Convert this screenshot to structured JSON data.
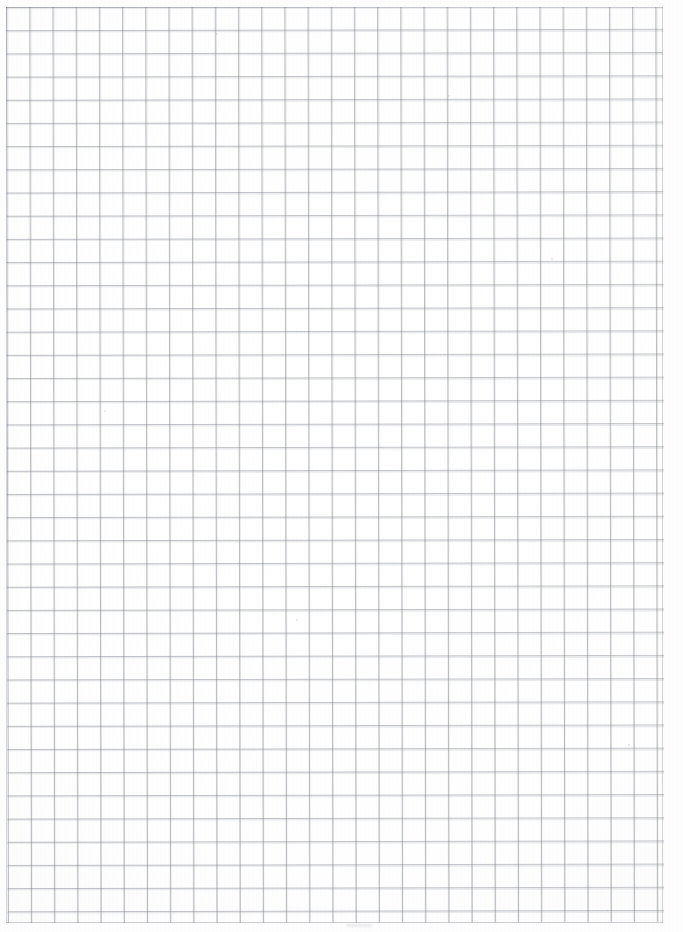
{
  "document": {
    "kind": "scanned-graph-paper",
    "title": "Blank graph paper sheet",
    "description": "Scanned blank square-ruled graph paper with no handwriting, text, labels or markings.",
    "page_width_px": 683,
    "page_height_px": 932,
    "paper_color": "#fdfdfd",
    "grid_line_color": "#787d87",
    "visible_text": ""
  },
  "grid": {
    "cell_size_px": 23.2,
    "columns": 28,
    "rows": 39,
    "origin_x_px": 6,
    "origin_y_px": 6.5,
    "ruled_width_px": 657,
    "ruled_height_px": 916,
    "line_weight_px": 0.9,
    "skew_degrees": -0.12,
    "has_bold_major_lines": false,
    "margins": {
      "left_px": 6,
      "top_px": 6.5,
      "right_px": 19.5,
      "bottom_px": 9
    }
  },
  "artifacts": {
    "bottom_center_smudge": "faint horizontal scan mark below ruled area",
    "specks": [
      {
        "x": 216,
        "y": 33
      },
      {
        "x": 104,
        "y": 410
      },
      {
        "x": 448,
        "y": 95
      },
      {
        "x": 551,
        "y": 258
      },
      {
        "x": 296,
        "y": 619
      },
      {
        "x": 628,
        "y": 744
      }
    ]
  }
}
